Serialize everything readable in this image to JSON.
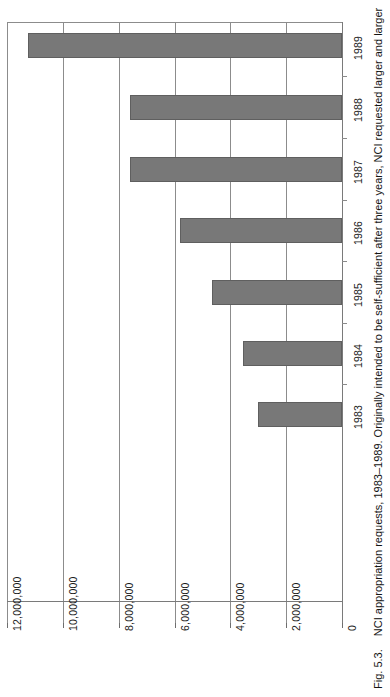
{
  "figure": {
    "number_label": "Fig. 5.3.",
    "caption": "NCI appropriation requests, 1983–1989. Originally intended to be self-sufficient after three years, NCI requested larger and larger"
  },
  "chart_data": {
    "type": "bar",
    "orientation": "horizontal",
    "title": "NCI appropriation requests, 1983–1989",
    "xlabel": "",
    "ylabel": "",
    "categories": [
      "1983",
      "1984",
      "1985",
      "1986",
      "1987",
      "1988",
      "1989"
    ],
    "values": [
      3000000,
      3550000,
      4650000,
      5800000,
      7600000,
      7600000,
      11250000
    ],
    "xlim": [
      0,
      12000000
    ],
    "xticks": [
      0,
      2000000,
      4000000,
      6000000,
      8000000,
      10000000,
      12000000
    ],
    "xticklabels": [
      "0",
      "2,000,000",
      "4,000,000",
      "6,000,000",
      "8,000,000",
      "10,000,000",
      "12,000,000"
    ],
    "grid": true,
    "legend": null,
    "bar_color": "#787878",
    "axis_color": "#7a7a7a",
    "gridline_color": "#8c8c8c",
    "background": "#ffffff"
  }
}
